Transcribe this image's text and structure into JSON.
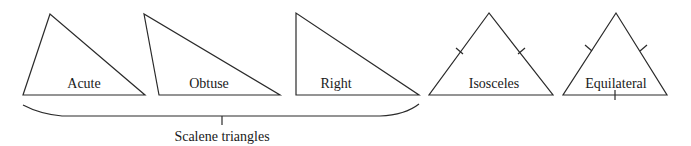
{
  "diagram": {
    "stroke_color": "#2a2a2a",
    "text_color": "#1a1a1a",
    "triangles": [
      {
        "label": "Acute",
        "points": "50,14 23,95 145,95",
        "label_x": 84,
        "label_y": 80
      },
      {
        "label": "Obtuse",
        "points": "144,14 159,95 280,95",
        "label_x": 209,
        "label_y": 80
      },
      {
        "label": "Right",
        "points": "296,13 296,95 419,95",
        "label_x": 336,
        "label_y": 80
      },
      {
        "label": "Isosceles",
        "points": "489,13 429,95 553,95",
        "label_x": 494,
        "label_y": 80
      },
      {
        "label": "Equilateral",
        "points": "616,13 563,95 667,95",
        "label_x": 616,
        "label_y": 80
      }
    ],
    "group_label": "Scalene triangles"
  }
}
